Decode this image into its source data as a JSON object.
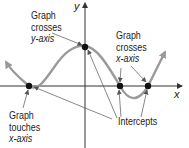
{
  "diagram": {
    "type": "function-graph-intercepts",
    "axes": {
      "x_label": "x",
      "y_label": "y"
    },
    "labels": {
      "crosses_y": [
        "Graph",
        "crosses",
        "y-axis"
      ],
      "crosses_x": [
        "Graph",
        "crosses",
        "x-axis"
      ],
      "touches_x": [
        "Graph",
        "touches",
        "x-axis"
      ],
      "intercepts": "Intercepts"
    },
    "points": [
      {
        "name": "touch-x-intercept",
        "role": "Graph touches x-axis"
      },
      {
        "name": "y-intercept",
        "role": "Graph crosses y-axis"
      },
      {
        "name": "cross-x-intercept-1",
        "role": "Graph crosses x-axis"
      },
      {
        "name": "cross-x-intercept-2",
        "role": "Graph crosses x-axis"
      }
    ],
    "colors": {
      "curve": "#9a9a9a",
      "axis": "#333333",
      "point": "#111111",
      "pointer": "#555555"
    }
  }
}
